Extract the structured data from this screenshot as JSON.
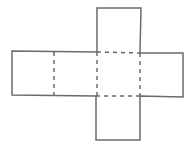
{
  "diagram": {
    "type": "cube-net",
    "colors": {
      "stroke": "#6b6b6b",
      "background": "#ffffff"
    },
    "faces": [
      {
        "id": "left-1",
        "x": 12,
        "y": 51,
        "size": 43
      },
      {
        "id": "left-2",
        "x": 54,
        "y": 52,
        "size": 43
      },
      {
        "id": "center",
        "x": 97,
        "y": 52,
        "size": 43
      },
      {
        "id": "right",
        "x": 140,
        "y": 53,
        "size": 43
      },
      {
        "id": "top",
        "x": 97,
        "y": 8,
        "size": 44
      },
      {
        "id": "bottom",
        "x": 96,
        "y": 96,
        "size": 44
      }
    ],
    "fold_lines": 5,
    "solid_edges": "outer outline"
  }
}
